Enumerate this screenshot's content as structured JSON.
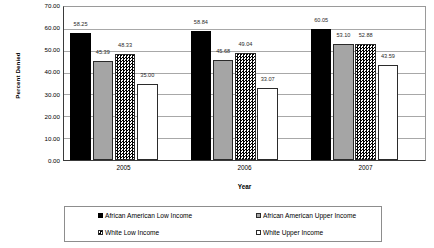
{
  "chart_data": {
    "type": "bar",
    "title": "",
    "xlabel": "Year",
    "ylabel": "Percent Denied",
    "ylim": [
      0,
      70
    ],
    "ytick_step": 10,
    "grid": true,
    "legend_position": "bottom",
    "categories": [
      "2005",
      "2006",
      "2007"
    ],
    "ytick_labels": [
      "70.00",
      "60.00",
      "50.00",
      "40.00",
      "30.00",
      "20.00",
      "10.00",
      "0.00"
    ],
    "series": [
      {
        "name": "African American Low Income",
        "swatch": "solid-black",
        "color": "#000000",
        "values": [
          58.25,
          58.84,
          60.05
        ],
        "labels": [
          "58.25",
          "58.84",
          "60.05"
        ]
      },
      {
        "name": "African American Upper Income",
        "swatch": "solid-gray",
        "color": "#a5a5a5",
        "values": [
          45.39,
          45.68,
          53.1
        ],
        "labels": [
          "45.39",
          "45.68",
          "53.10"
        ]
      },
      {
        "name": "White Low Income",
        "swatch": "checkered",
        "color": "#000000",
        "values": [
          48.33,
          49.04,
          52.88
        ],
        "labels": [
          "48.33",
          "49.04",
          "52.88"
        ]
      },
      {
        "name": "White Upper Income",
        "swatch": "white-outline",
        "color": "#ffffff",
        "values": [
          35.0,
          33.07,
          43.59
        ],
        "labels": [
          "35.00",
          "33.07",
          "43.59"
        ]
      }
    ]
  }
}
